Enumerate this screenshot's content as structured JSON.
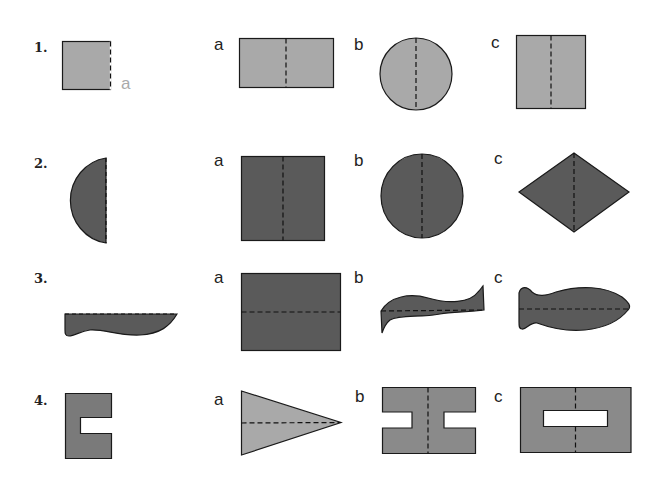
{
  "worksheet": {
    "topic": "Lines of symmetry — identify the shape formed when unfolded along the dashed fold line",
    "colors": {
      "light_fill": "#a9a9a9",
      "dark_fill": "#5a5a5a",
      "outline": "#1a1a1a",
      "fold_line": "#111111",
      "ghost_label": "#aaaaaa"
    },
    "questions": [
      {
        "number": "1.",
        "given_shape": "square-half with dashed fold on right edge",
        "given_label": "a",
        "options": [
          {
            "label": "a",
            "shape": "rectangle with vertical fold"
          },
          {
            "label": "b",
            "shape": "circle with vertical fold"
          },
          {
            "label": "c",
            "shape": "square with vertical fold"
          }
        ]
      },
      {
        "number": "2.",
        "given_shape": "half-circle with dashed fold on right edge",
        "options": [
          {
            "label": "a",
            "shape": "square with vertical fold"
          },
          {
            "label": "b",
            "shape": "circle with vertical fold"
          },
          {
            "label": "c",
            "shape": "rhombus with vertical fold"
          }
        ]
      },
      {
        "number": "3.",
        "given_shape": "knife-like half shape with dashed fold on top edge",
        "options": [
          {
            "label": "a",
            "shape": "rectangle with horizontal fold"
          },
          {
            "label": "b",
            "shape": "wavy ribbon with horizontal fold"
          },
          {
            "label": "c",
            "shape": "fish shape with horizontal fold"
          }
        ]
      },
      {
        "number": "4.",
        "given_shape": "C-shaped half with notch",
        "options": [
          {
            "label": "a",
            "shape": "triangle with horizontal fold"
          },
          {
            "label": "b",
            "shape": "H-shape with vertical fold"
          },
          {
            "label": "c",
            "shape": "rectangle with slot and vertical fold"
          }
        ]
      }
    ]
  }
}
